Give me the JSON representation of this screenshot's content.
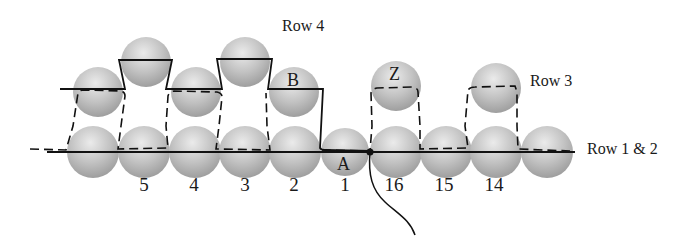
{
  "diagram": {
    "row_labels": {
      "row4": "Row 4",
      "row3": "Row 3",
      "row12": "Row 1 & 2"
    },
    "bead_letters": {
      "b": "B",
      "z": "Z",
      "a": "A"
    },
    "bead_numbers": [
      "5",
      "4",
      "3",
      "2",
      "1",
      "16",
      "15",
      "14"
    ],
    "colors": {
      "bead_light": "#e6e6e6",
      "bead_mid": "#bdbdbd",
      "bead_dark": "#9a9a9a",
      "thread": "#111111"
    }
  }
}
